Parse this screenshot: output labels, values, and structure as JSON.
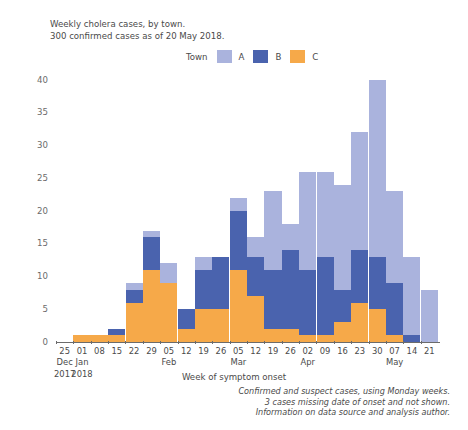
{
  "titles": {
    "line1": "Weekly cholera cases, by town.",
    "line2": "300 confirmed cases as of 20 May 2018."
  },
  "legend": {
    "title": "Town",
    "position": "top-center",
    "items": [
      {
        "label": "A",
        "color": "#aab3dd"
      },
      {
        "label": "B",
        "color": "#4a63ae"
      },
      {
        "label": "C",
        "color": "#f6a949"
      }
    ]
  },
  "footnotes": [
    "Confirmed and suspect cases, using Monday weeks.",
    "3 cases missing date of onset and not shown.",
    "Information on data source and analysis author."
  ],
  "chart_data": {
    "type": "bar",
    "stacked": true,
    "title": "Weekly cholera cases, by town.",
    "subtitle": "300 confirmed cases as of 20 May 2018.",
    "xlabel": "Week of symptom onset",
    "ylabel": "Weekly cases",
    "ylim": [
      0,
      40
    ],
    "yticks": [
      0,
      5,
      10,
      15,
      20,
      25,
      30,
      35,
      40
    ],
    "grid": false,
    "categories": [
      "25",
      "01",
      "08",
      "15",
      "22",
      "29",
      "05",
      "12",
      "19",
      "26",
      "05",
      "12",
      "19",
      "26",
      "02",
      "09",
      "16",
      "23",
      "30",
      "07",
      "14",
      "21"
    ],
    "month_labels": [
      {
        "index": 0,
        "text": "Dec"
      },
      {
        "index": 1,
        "text": "Jan"
      },
      {
        "index": 6,
        "text": "Feb"
      },
      {
        "index": 10,
        "text": "Mar"
      },
      {
        "index": 14,
        "text": "Apr"
      },
      {
        "index": 19,
        "text": "May"
      }
    ],
    "year_labels": [
      {
        "index": 0,
        "text": "2017"
      },
      {
        "index": 1,
        "text": "2018"
      }
    ],
    "series": [
      {
        "name": "C",
        "color": "#f6a949",
        "values": [
          0,
          1,
          1,
          1,
          6,
          11,
          9,
          2,
          5,
          5,
          11,
          7,
          2,
          2,
          1,
          1,
          3,
          6,
          5,
          1,
          0,
          0
        ]
      },
      {
        "name": "B",
        "color": "#4a63ae",
        "values": [
          0,
          0,
          0,
          1,
          2,
          5,
          0,
          3,
          6,
          8,
          9,
          6,
          9,
          12,
          10,
          12,
          5,
          8,
          8,
          8,
          1,
          0
        ]
      },
      {
        "name": "A",
        "color": "#aab3dd",
        "values": [
          0,
          0,
          0,
          0,
          1,
          1,
          3,
          0,
          2,
          0,
          2,
          3,
          12,
          4,
          15,
          13,
          16,
          18,
          27,
          14,
          12,
          8
        ]
      }
    ],
    "totals": [
      0,
      1,
      1,
      2,
      9,
      17,
      12,
      5,
      13,
      13,
      22,
      16,
      23,
      18,
      26,
      26,
      24,
      32,
      40,
      23,
      13,
      8
    ]
  }
}
